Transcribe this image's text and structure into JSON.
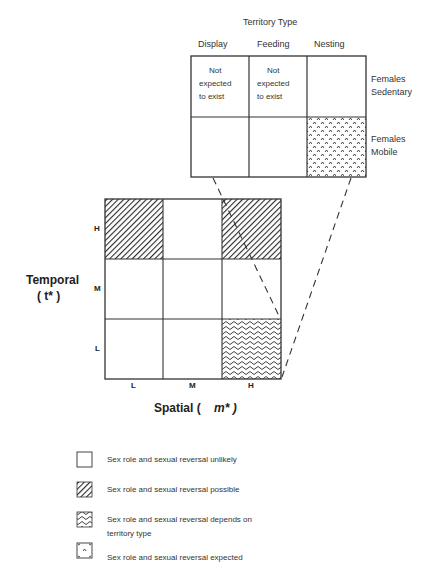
{
  "inset": {
    "title": "Territory Type",
    "columns": [
      {
        "label": "Display"
      },
      {
        "label": "Feeding"
      },
      {
        "label": "Nesting"
      }
    ],
    "rows": [
      {
        "label_line1": "Females",
        "label_line2": "Sedentary"
      },
      {
        "label_line1": "Females",
        "label_line2": "Mobile"
      }
    ],
    "cells": [
      [
        "Not expected to exist",
        "Not expected to exist",
        ""
      ],
      [
        "",
        "",
        ""
      ]
    ],
    "not_expected_line1": "Not",
    "not_expected_line2": "expected",
    "not_expected_line3": "to exist"
  },
  "main_grid": {
    "y_axis_label": "Temporal",
    "y_axis_symbol": "( t* )",
    "x_axis_label": "Spatial (",
    "x_axis_symbol": "m* )",
    "x_ticks": [
      "L",
      "M",
      "H"
    ],
    "y_ticks": [
      "H",
      "M",
      "L"
    ],
    "cells": [
      [
        "possible",
        "unlikely",
        "possible"
      ],
      [
        "unlikely",
        "unlikely",
        "unlikely"
      ],
      [
        "unlikely",
        "unlikely",
        "depends"
      ]
    ]
  },
  "legend": [
    {
      "pattern": "blank",
      "label": "Sex role and sexual reversal unlikely"
    },
    {
      "pattern": "diagonal-hatch",
      "label": "Sex role and sexual reversal possible"
    },
    {
      "pattern": "wavy",
      "label": "Sex role and sexual reversal depends on",
      "label2": "territory type"
    },
    {
      "pattern": "caret-dots",
      "label": "Sex role and sexual reversal expected"
    }
  ],
  "colors": {
    "line": "#333333",
    "hatch": "#2a2a2a",
    "background": "#ffffff"
  }
}
